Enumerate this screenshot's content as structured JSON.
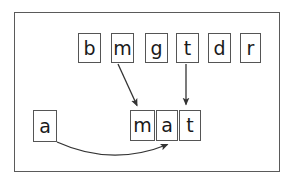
{
  "diagram": {
    "frame": {
      "x": 14,
      "y": 12,
      "width": 266,
      "height": 160,
      "border_color": "#5a5a5a",
      "background": "#ffffff"
    },
    "tile_style": {
      "fill": "#ffffff",
      "border_color": "#555555",
      "text_color": "#1a1a1a"
    },
    "letter_bank": {
      "name": "top-letter-row",
      "tiles": [
        {
          "letter": "b",
          "x": 78,
          "y": 33,
          "w": 23,
          "h": 30
        },
        {
          "letter": "m",
          "x": 111,
          "y": 33,
          "w": 23,
          "h": 30
        },
        {
          "letter": "g",
          "x": 145,
          "y": 33,
          "w": 23,
          "h": 30
        },
        {
          "letter": "t",
          "x": 176,
          "y": 33,
          "w": 23,
          "h": 30
        },
        {
          "letter": "d",
          "x": 208,
          "y": 33,
          "w": 23,
          "h": 30
        },
        {
          "letter": "r",
          "x": 240,
          "y": 33,
          "w": 21,
          "h": 30
        }
      ]
    },
    "source_tile": {
      "name": "left-letter-tile",
      "letter": "a",
      "x": 33,
      "y": 110,
      "w": 24,
      "h": 32
    },
    "target_word": {
      "name": "built-word-row",
      "word": "mat",
      "tiles": [
        {
          "letter": "m",
          "x": 130,
          "y": 110,
          "w": 25,
          "h": 31
        },
        {
          "letter": "a",
          "x": 156,
          "y": 110,
          "w": 22,
          "h": 31
        },
        {
          "letter": "t",
          "x": 179,
          "y": 110,
          "w": 22,
          "h": 31
        }
      ]
    },
    "arrows": [
      {
        "name": "arrow-m-diagonal",
        "kind": "straight",
        "from_letter": "m",
        "to_letter": "m",
        "x1": 118,
        "y1": 64,
        "x2": 137,
        "y2": 107,
        "color": "#333333"
      },
      {
        "name": "arrow-t-vertical",
        "kind": "straight",
        "from_letter": "t",
        "to_letter": "t",
        "x1": 186,
        "y1": 64,
        "x2": 186,
        "y2": 106,
        "color": "#333333"
      },
      {
        "name": "arrow-a-curved",
        "kind": "curved",
        "from_letter": "a",
        "to_letter": "a",
        "x1": 57,
        "y1": 142,
        "cx": 110,
        "cy": 163,
        "x2": 169,
        "y2": 143,
        "color": "#333333"
      }
    ]
  }
}
